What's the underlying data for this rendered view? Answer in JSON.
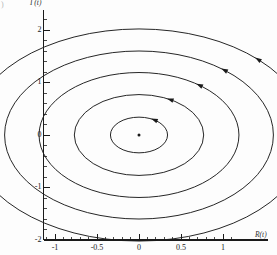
{
  "figure": {
    "background_color": "#fdfdfd",
    "line_color": "#1a1a1a",
    "corner_mark": ")"
  },
  "axes": {
    "y_title": "I (t)",
    "x_title": "R(t)",
    "y_ticks_major": [
      "2",
      "1",
      "0",
      "-1",
      "-2"
    ],
    "x_ticks_major": [
      "-1",
      "-0.5",
      "0",
      "0.5",
      "1"
    ]
  },
  "chart_data": {
    "type": "line",
    "title": "",
    "xlabel": "R(t)",
    "ylabel": "I (t)",
    "xlim": [
      -1.15,
      1.15
    ],
    "ylim": [
      -2.1,
      2.35
    ],
    "grid": false,
    "legend": "none",
    "x_major_ticks": [
      -1,
      -0.5,
      0,
      0.5,
      1
    ],
    "x_major_tick_labels": [
      "-1",
      "-0.5",
      "0",
      "0.5",
      "1"
    ],
    "x_minor_tick_step": 0.1,
    "y_major_ticks": [
      2,
      1,
      0,
      -1,
      -2
    ],
    "y_major_tick_labels": [
      "2",
      "1",
      "0",
      "-1",
      "-2"
    ],
    "y_minor_tick_step": 0.2,
    "center": [
      0,
      0
    ],
    "center_marker": "dot",
    "series": [
      {
        "name": "orbit-1",
        "shape": "circle",
        "radius": 0.34,
        "arrow_angle_deg": 55
      },
      {
        "name": "orbit-2",
        "shape": "circle",
        "radius": 0.77,
        "arrow_angle_deg": 60
      },
      {
        "name": "orbit-3",
        "shape": "circle",
        "radius": 1.19,
        "arrow_angle_deg": 52
      },
      {
        "name": "orbit-4",
        "shape": "circle",
        "radius": 1.6,
        "arrow_angle_deg": 50
      },
      {
        "name": "orbit-5",
        "shape": "circle",
        "radius": 2.02,
        "arrow_angle_deg": 45
      }
    ],
    "arrow_direction": "counterclockwise"
  }
}
